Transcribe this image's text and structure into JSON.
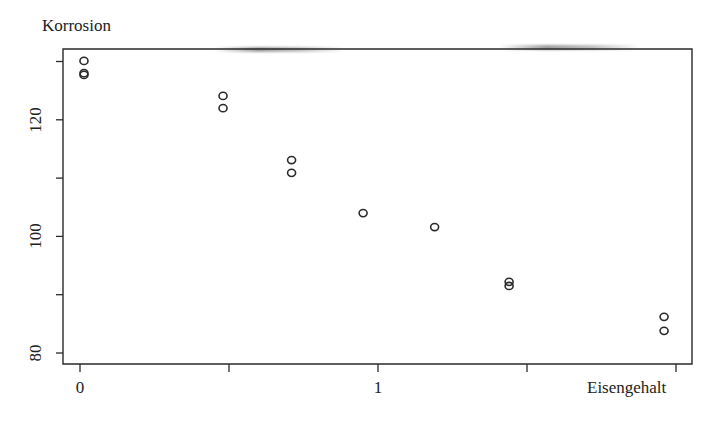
{
  "chart_data": {
    "type": "scatter",
    "title": "",
    "ylabel": "Korrosion",
    "xlabel": "Eisengehalt",
    "xlim": [
      -0.02,
      2.05
    ],
    "ylim": [
      79,
      131
    ],
    "x_ticks": [
      0,
      0.5,
      1,
      1.5,
      2
    ],
    "x_tick_labels": [
      "0",
      "",
      "1",
      "",
      ""
    ],
    "y_ticks": [
      80,
      90,
      100,
      110,
      120,
      130
    ],
    "y_tick_labels": [
      "80",
      "",
      "100",
      "",
      "120",
      ""
    ],
    "grid": false,
    "legend": null,
    "marker": "open-circle",
    "series": [
      {
        "name": "Korrosion vs Eisengehalt",
        "points": [
          {
            "x": 0.01,
            "y": 130.1
          },
          {
            "x": 0.01,
            "y": 128.0
          },
          {
            "x": 0.01,
            "y": 127.7
          },
          {
            "x": 0.48,
            "y": 124.1
          },
          {
            "x": 0.48,
            "y": 122.0
          },
          {
            "x": 0.71,
            "y": 113.1
          },
          {
            "x": 0.71,
            "y": 110.9
          },
          {
            "x": 0.95,
            "y": 104.0
          },
          {
            "x": 1.19,
            "y": 101.6
          },
          {
            "x": 1.44,
            "y": 92.2
          },
          {
            "x": 1.44,
            "y": 91.5
          },
          {
            "x": 1.96,
            "y": 86.2
          },
          {
            "x": 1.96,
            "y": 83.8
          }
        ]
      }
    ]
  },
  "labels": {
    "y_axis_title": "Korrosion",
    "x_axis_title": "Eisengehalt"
  },
  "colors": {
    "ink": "#2a2a2a",
    "background": "#ffffff"
  }
}
